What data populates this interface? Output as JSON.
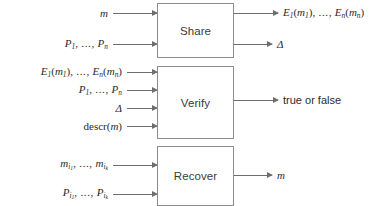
{
  "diagram": {
    "type": "flow-diagram",
    "title": "",
    "background_color": "#ffffff",
    "box_border_color": "#8c8c8c",
    "arrow_color": "#6e6e6e",
    "text_color": "#2b2b2b",
    "nodes": [
      {
        "id": "share",
        "label": "Share"
      },
      {
        "id": "verify",
        "label": "Verify"
      },
      {
        "id": "recover",
        "label": "Recover"
      }
    ],
    "share": {
      "label": "Share",
      "inputs": [
        {
          "id": "share-in-1",
          "text": "m"
        },
        {
          "id": "share-in-2",
          "text": "P1, ..., Pn"
        }
      ],
      "outputs": [
        {
          "id": "share-out-1",
          "text": "E1(m1), ..., En(mn)"
        },
        {
          "id": "share-out-2",
          "text": "Δ"
        }
      ]
    },
    "verify": {
      "label": "Verify",
      "inputs": [
        {
          "id": "verify-in-1",
          "text": "E1(m1), ..., En(mn)"
        },
        {
          "id": "verify-in-2",
          "text": "P1, ..., Pn"
        },
        {
          "id": "verify-in-3",
          "text": "Δ"
        },
        {
          "id": "verify-in-4",
          "text": "descr(m)"
        }
      ],
      "outputs": [
        {
          "id": "verify-out-1",
          "text": "true or false"
        }
      ]
    },
    "recover": {
      "label": "Recover",
      "inputs": [
        {
          "id": "recover-in-1",
          "text": "mi1, ..., mik"
        },
        {
          "id": "recover-in-2",
          "text": "Pi1, ..., Pik"
        }
      ],
      "outputs": [
        {
          "id": "recover-out-1",
          "text": "m"
        }
      ]
    }
  }
}
